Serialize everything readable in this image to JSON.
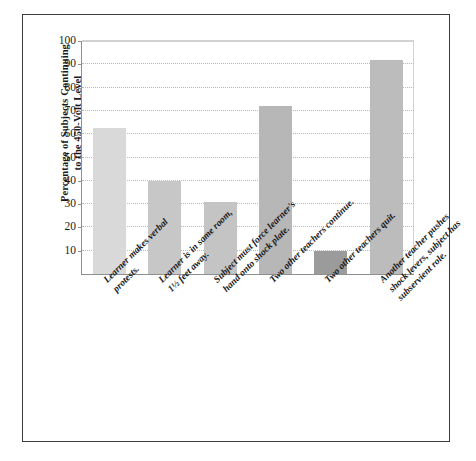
{
  "chart_data": {
    "type": "bar",
    "title": "",
    "xlabel": "",
    "ylabel": "Percentage of Subjects Continuing\nto the 450-Volt Level",
    "ylabel_line1": "Percentage of Subjects Continuing",
    "ylabel_line2": "to the 450-Volt Level",
    "ylim": [
      0,
      100
    ],
    "grid": true,
    "legend": "none",
    "y_ticks": [
      10,
      20,
      30,
      40,
      50,
      60,
      70,
      80,
      90,
      100
    ],
    "categories": [
      "Learner makes verbal\nprotests.",
      "Learner is in same room,\n1½ feet away.",
      "Subject must force learner's\nhand onto shock plate.",
      "Two other teachers continue.",
      "Two other teachers quit.",
      "Another teacher pushes\nshock levers, subject has\nsubservient role."
    ],
    "values": [
      62.5,
      40,
      31,
      72,
      10,
      92
    ],
    "bar_colors": [
      "#d9d9d9",
      "#c7c7c7",
      "#c4c4c4",
      "#b7b7b7",
      "#9b9b9b",
      "#bcbcbc"
    ]
  },
  "colors": {
    "frame": "#3a3a3a",
    "axis": "#8f8f8f",
    "gridline": "#b9b9b9",
    "background": "#ffffff",
    "text": "#1a1a1a"
  }
}
